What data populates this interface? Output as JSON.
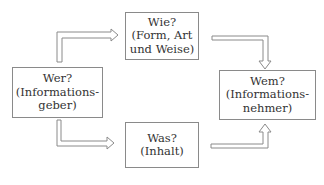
{
  "diagram": {
    "type": "communication-model",
    "nodes": {
      "sender": {
        "lines": [
          "Wer?",
          "(Informations-",
          "geber)"
        ]
      },
      "how": {
        "lines": [
          "Wie?",
          "(Form, Art",
          "und Weise)"
        ]
      },
      "what": {
        "lines": [
          "Was?",
          "(Inhalt)"
        ]
      },
      "receiver": {
        "lines": [
          "Wem?",
          "(Informations-",
          "nehmer)"
        ]
      }
    },
    "edges": [
      {
        "from": "sender",
        "to": "how"
      },
      {
        "from": "sender",
        "to": "what"
      },
      {
        "from": "how",
        "to": "receiver"
      },
      {
        "from": "what",
        "to": "receiver"
      }
    ],
    "colors": {
      "border": "#8a8a8a",
      "text": "#333333",
      "arrow": "#8a8a8a"
    }
  }
}
